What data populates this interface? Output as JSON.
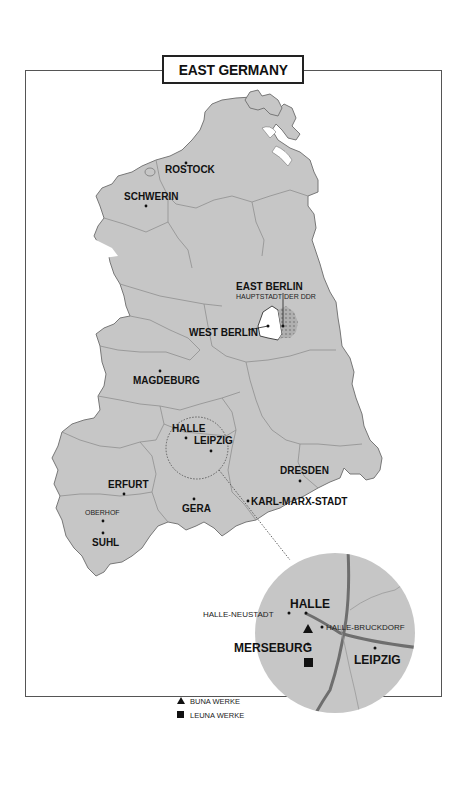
{
  "title": "EAST GERMANY",
  "colors": {
    "land": "#c6c6c6",
    "border": "#8a8a8a",
    "outline": "#777777",
    "road": "#6e6e6e",
    "text": "#111111",
    "frame": "#555555",
    "west_berlin": "#ffffff",
    "east_berlin_hatch": "#9a9a9a"
  },
  "cities": {
    "rostock": "ROSTOCK",
    "schwerin": "SCHWERIN",
    "east_berlin": "EAST BERLIN",
    "east_berlin_sub": "HAUPTSTADT DER DDR",
    "west_berlin": "WEST BERLIN",
    "magdeburg": "MAGDEBURG",
    "halle": "HALLE",
    "leipzig": "LEIPZIG",
    "dresden": "DRESDEN",
    "erfurt": "ERFURT",
    "gera": "GERA",
    "karl_marx_stadt": "KARL-MARX-STADT",
    "oberhof": "OBERHOF",
    "suhl": "SUHL"
  },
  "inset": {
    "halle": "HALLE",
    "halle_neustadt": "HALLE-NEUSTADT",
    "halle_bruckdorf": "HALLE-BRUCKDORF",
    "merseburg": "MERSEBURG",
    "leipzig": "LEIPZIG"
  },
  "legend": [
    {
      "symbol": "triangle",
      "label": "BUNA WERKE"
    },
    {
      "symbol": "square",
      "label": "LEUNA WERKE"
    }
  ]
}
